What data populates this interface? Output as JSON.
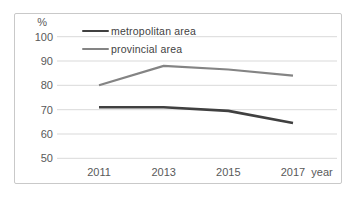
{
  "chart_data": {
    "type": "line",
    "title": "",
    "ylabel": "%",
    "xlabel": "year",
    "categories": [
      "2011",
      "2013",
      "2015",
      "2017"
    ],
    "series": [
      {
        "name": "metropolitan area",
        "values": [
          71,
          71,
          69.5,
          64.5
        ],
        "color": "#404040",
        "line_width": 2.6
      },
      {
        "name": "provincial area",
        "values": [
          80,
          88,
          86.5,
          84
        ],
        "color": "#848484",
        "line_width": 2.2
      }
    ],
    "ylim": [
      50,
      100
    ],
    "ytick_step": 10,
    "grid": true,
    "legend_position": "top-left",
    "colors": {
      "axis_text": "#595959",
      "grid_line": "#d9d9d9",
      "frame_border": "#c9c9c9",
      "background": "#ffffff"
    }
  }
}
